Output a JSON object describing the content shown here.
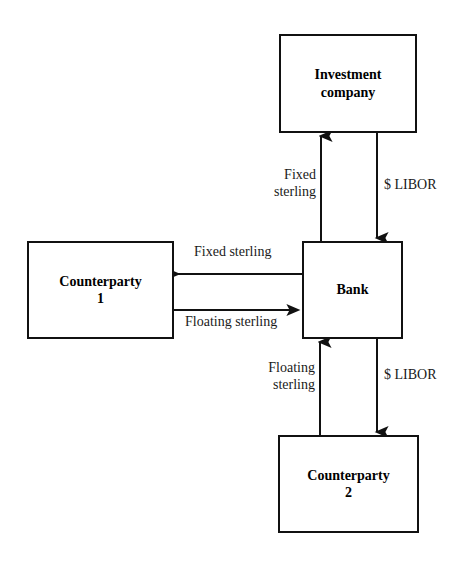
{
  "diagram": {
    "background_color": "#ffffff",
    "line_color": "#111111",
    "text_color": "#000000"
  },
  "nodes": [
    {
      "id": "investment-company",
      "label": "Investment\ncompany",
      "x": 279,
      "y": 34,
      "width": 138,
      "height": 99
    },
    {
      "id": "counterparty-1",
      "label": "Counterparty\n1",
      "x": 27,
      "y": 241,
      "width": 147,
      "height": 98
    },
    {
      "id": "bank",
      "label": "Bank",
      "x": 302,
      "y": 241,
      "width": 101,
      "height": 98
    },
    {
      "id": "counterparty-2",
      "label": "Counterparty\n2",
      "x": 278,
      "y": 435,
      "width": 141,
      "height": 98
    }
  ],
  "edges": [
    {
      "id": "bank-to-investment-company",
      "label": "Fixed\nsterling",
      "from": "bank",
      "to": "investment-company",
      "direction": "up",
      "x1": 321,
      "y1": 241,
      "x2": 321,
      "y2": 133
    },
    {
      "id": "investment-company-to-bank",
      "label": "$ LIBOR",
      "from": "investment-company",
      "to": "bank",
      "direction": "down",
      "x1": 377,
      "y1": 133,
      "x2": 377,
      "y2": 241
    },
    {
      "id": "bank-to-counterparty-1",
      "label": "Fixed sterling",
      "from": "bank",
      "to": "counterparty-1",
      "direction": "left",
      "x1": 302,
      "y1": 274,
      "x2": 174,
      "y2": 274
    },
    {
      "id": "counterparty-1-to-bank",
      "label": "Floating sterling",
      "from": "counterparty-1",
      "to": "bank",
      "direction": "right",
      "x1": 174,
      "y1": 310,
      "x2": 302,
      "y2": 310
    },
    {
      "id": "counterparty-2-to-bank",
      "label": "Floating\nsterling",
      "from": "counterparty-2",
      "to": "bank",
      "direction": "up",
      "x1": 320,
      "y1": 435,
      "x2": 320,
      "y2": 339
    },
    {
      "id": "bank-to-counterparty-2",
      "label": "$ LIBOR",
      "from": "bank",
      "to": "counterparty-2",
      "direction": "down",
      "x1": 377,
      "y1": 339,
      "x2": 377,
      "y2": 435
    }
  ],
  "edge_labels": {
    "fixed_sterling_vertical": "Fixed\nsterling",
    "libor_top": "$ LIBOR",
    "fixed_sterling_horizontal": "Fixed sterling",
    "floating_sterling_horizontal": "Floating sterling",
    "floating_sterling_vertical": "Floating\nsterling",
    "libor_bottom": "$ LIBOR"
  }
}
